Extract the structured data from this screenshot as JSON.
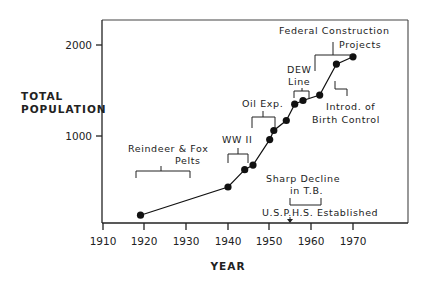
{
  "chart_data": {
    "type": "line",
    "title": "",
    "xlabel": "YEAR",
    "ylabel": "TOTAL POPULATION",
    "x_ticks": [
      1910,
      1920,
      1930,
      1940,
      1950,
      1960,
      1970
    ],
    "y_ticks": [
      1000,
      2000
    ],
    "xlim": [
      1910,
      1990
    ],
    "ylim": [
      0,
      2300
    ],
    "grid": false,
    "legend": "none",
    "series": [
      {
        "name": "Total Population",
        "marker": "filled-circle",
        "x": [
          1919,
          1940,
          1944,
          1946,
          1950,
          1951,
          1954,
          1956,
          1958,
          1962,
          1966,
          1970
        ],
        "y": [
          130,
          440,
          630,
          680,
          960,
          1060,
          1170,
          1350,
          1390,
          1450,
          1790,
          1870
        ]
      }
    ],
    "annotations": [
      {
        "id": "reindeer",
        "lines": [
          "Reindeer & Fox",
          "Pelts"
        ],
        "span": [
          1918,
          1931
        ],
        "bracket": "down"
      },
      {
        "id": "ww2",
        "lines": [
          "WW II"
        ],
        "span": [
          1941,
          1945
        ],
        "bracket": "down"
      },
      {
        "id": "oil",
        "lines": [
          "Oil Exp."
        ],
        "span": [
          1945,
          1950
        ],
        "bracket": "down"
      },
      {
        "id": "dew",
        "lines": [
          "DEW",
          "Line"
        ],
        "span": [
          1956,
          1959
        ],
        "bracket": "down"
      },
      {
        "id": "federal",
        "lines": [
          "Federal Construction",
          "Projects"
        ],
        "span": [
          1960,
          1970
        ],
        "bracket": "down"
      },
      {
        "id": "birth",
        "lines": [
          "Introd. of",
          "Birth Control"
        ],
        "year": 1965,
        "bracket": "corner"
      },
      {
        "id": "tb",
        "lines": [
          "Sharp Decline",
          "in T.B."
        ],
        "span": [
          1954,
          1962
        ],
        "bracket": "up"
      },
      {
        "id": "usphs",
        "lines": [
          "U.S.P.H.S. Established"
        ],
        "year": 1955,
        "marker": "arrow-down"
      }
    ]
  },
  "labels": {
    "y_axis_line1": "TOTAL",
    "y_axis_line2": "POPULATION",
    "x_axis": "YEAR",
    "y_tick_2000": "2000",
    "y_tick_1000": "1000",
    "x_tick_1910": "1910",
    "x_tick_1920": "1920",
    "x_tick_1930": "1930",
    "x_tick_1940": "1940",
    "x_tick_1950": "1950",
    "x_tick_1960": "1960",
    "x_tick_1970": "1970",
    "reindeer_1": "Reindeer & Fox",
    "reindeer_2": "Pelts",
    "ww2": "WW II",
    "oil": "Oil Exp.",
    "dew_1": "DEW",
    "dew_2": "Line",
    "federal_1": "Federal Construction",
    "federal_2": "Projects",
    "birth_1": "Introd. of",
    "birth_2": "Birth Control",
    "tb_1": "Sharp Decline",
    "tb_2": "in T.B.",
    "usphs": "U.S.P.H.S. Established"
  }
}
